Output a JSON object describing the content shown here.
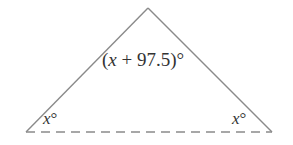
{
  "diagram": {
    "type": "triangle",
    "apex_angle": {
      "variable": "x",
      "expression_prefix": "(",
      "expression_suffix": " + 97.5)°"
    },
    "left_angle": {
      "variable": "x",
      "suffix": "°"
    },
    "right_angle": {
      "variable": "x",
      "suffix": "°"
    },
    "base_style": "dashed",
    "colors": {
      "stroke": "#8a8a8a",
      "text": "#333333"
    }
  }
}
